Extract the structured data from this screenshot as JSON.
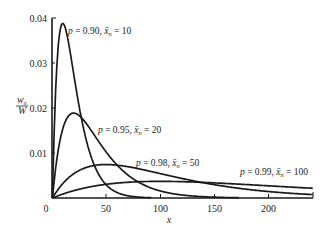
{
  "chart_data": {
    "type": "line",
    "title": "",
    "xlabel": "x",
    "ylabel": "w_x / W",
    "xlim": [
      0,
      241
    ],
    "ylim": [
      0,
      0.04
    ],
    "grid": false,
    "legend": "inline curve labels",
    "x_ticks": [
      0,
      50,
      100,
      150,
      200
    ],
    "y_ticks": [
      0.01,
      0.02,
      0.03,
      0.04
    ],
    "x_tick_labels": [
      "0",
      "50",
      "100",
      "150",
      "200"
    ],
    "y_tick_labels": [
      "0.01",
      "0.02",
      "0.03",
      "0.04"
    ],
    "formula": "w_x/W = x (1-p)^2 p^(x-1)",
    "series": [
      {
        "name": "p = 0.90, x̄n = 10",
        "p": 0.9,
        "xn": 10,
        "peak_x": 10,
        "peak_y": 0.0387
      },
      {
        "name": "p = 0.95, x̄n = 20",
        "p": 0.95,
        "xn": 20,
        "peak_x": 20,
        "peak_y": 0.0189
      },
      {
        "name": "p = 0.98, x̄n = 50",
        "p": 0.98,
        "xn": 50,
        "peak_x": 50,
        "peak_y": 0.0074
      },
      {
        "name": "p = 0.99, x̄n = 100",
        "p": 0.99,
        "xn": 100,
        "peak_x": 100,
        "peak_y": 0.0037
      }
    ]
  },
  "axes": {
    "ylabel_num": "w",
    "ylabel_sub": "x",
    "ylabel_den": "W",
    "xlabel": "x",
    "origin_label": "0"
  },
  "labels": [
    {
      "p_text": "p",
      "p_val": " = 0.90, ",
      "xbar": "x̄",
      "sub": "n",
      "n_val": " = 10"
    },
    {
      "p_text": "p",
      "p_val": " = 0.95, ",
      "xbar": "x̄",
      "sub": "n",
      "n_val": " = 20"
    },
    {
      "p_text": "p",
      "p_val": " = 0.98, ",
      "xbar": "x̄",
      "sub": "n",
      "n_val": " = 50"
    },
    {
      "p_text": "p",
      "p_val": " = 0.99, ",
      "xbar": "x̄",
      "sub": "n",
      "n_val": " = 100"
    }
  ],
  "colors": {
    "ink": "#1a1a1a",
    "background": "#ffffff"
  }
}
